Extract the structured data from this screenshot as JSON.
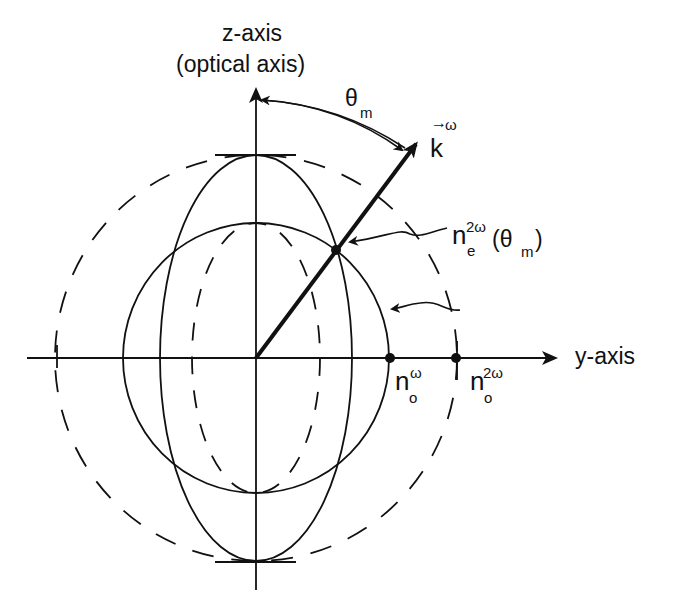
{
  "diagram": {
    "axes": {
      "z_label": "z-axis",
      "z_sublabel": "(optical axis)",
      "y_label": "y-axis"
    },
    "angle": {
      "symbol": "θ",
      "subscript": "m"
    },
    "wave_vector": {
      "symbol": "k",
      "superscript": "ω"
    },
    "labels": {
      "ne_symbol": "n",
      "ne_superscript": "2ω",
      "ne_subscript": "e",
      "ne_argument_open": "(θ",
      "ne_argument_sub": "m",
      "ne_argument_close": ")",
      "no_w_symbol": "n",
      "no_w_superscript": "ω",
      "no_w_subscript": "o",
      "no_2w_symbol": "n",
      "no_2w_superscript": "2ω",
      "no_2w_subscript": "o"
    },
    "curves": [
      {
        "name": "ordinary-circle-omega",
        "style": "solid",
        "rx": 133,
        "ry": 135
      },
      {
        "name": "extraordinary-ellipse-omega",
        "style": "solid",
        "rx": 96,
        "ry": 203
      },
      {
        "name": "ordinary-circle-2omega",
        "style": "dashed",
        "rx": 201,
        "ry": 203
      },
      {
        "name": "extraordinary-ellipse-2omega",
        "style": "dashed",
        "rx": 64,
        "ry": 135
      }
    ],
    "colors": {
      "ink": "#111111",
      "background": "#ffffff"
    }
  }
}
